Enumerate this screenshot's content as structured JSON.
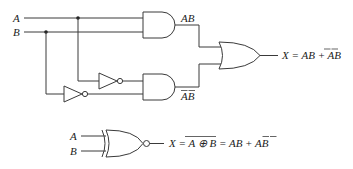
{
  "circuit": {
    "inputs": [
      {
        "label": "A"
      },
      {
        "label": "B"
      }
    ],
    "and_gate_top": {
      "output_label": "AB"
    },
    "and_gate_bottom": {
      "output_label_base": "AB",
      "overbars": [
        "A",
        "B"
      ]
    },
    "or_gate": {
      "output_expression_prefix": "X = AB + ",
      "output_term": "AB",
      "overbars_on_term": [
        "A",
        "B"
      ]
    }
  },
  "xnor_equivalent": {
    "inputs": [
      {
        "label": "A"
      },
      {
        "label": "B"
      }
    ],
    "expression_prefix": "X = ",
    "expression_xor": "A ⊕ B",
    "expression_suffix": " = AB + ",
    "expression_last_term": "AB"
  },
  "colors": {
    "line": "#3a3a3a",
    "text": "#222222",
    "background": "#ffffff"
  }
}
